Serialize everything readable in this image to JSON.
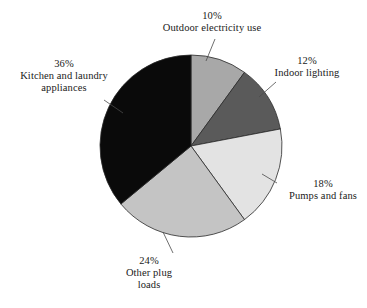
{
  "chart_data": {
    "type": "pie",
    "title": "",
    "subtitle": "",
    "xlabel": "",
    "ylabel": "",
    "legend_position": "none",
    "grid": false,
    "start_angle_deg": 0,
    "direction": "clockwise",
    "categories": [
      "Outdoor electricity use",
      "Indoor lighting",
      "Pumps and fans",
      "Other plug loads",
      "Kitchen and laundry appliances"
    ],
    "values": [
      10,
      12,
      18,
      24,
      36
    ],
    "value_unit": "%",
    "total": 100,
    "colors": [
      "#a8a8a8",
      "#5a5a5a",
      "#e3e3e3",
      "#c4c4c4",
      "#0a0a0a"
    ],
    "slices": [
      {
        "label": "Outdoor electricity use",
        "value": 10,
        "percent_text": "10%",
        "color": "#a8a8a8",
        "start_deg": 0,
        "end_deg": 36
      },
      {
        "label": "Indoor lighting",
        "value": 12,
        "percent_text": "12%",
        "color": "#5a5a5a",
        "start_deg": 36,
        "end_deg": 79.2
      },
      {
        "label": "Pumps and fans",
        "value": 18,
        "percent_text": "18%",
        "color": "#e3e3e3",
        "start_deg": 79.2,
        "end_deg": 144
      },
      {
        "label": "Other plug loads",
        "value": 24,
        "percent_text": "24%",
        "color": "#c4c4c4",
        "start_deg": 144,
        "end_deg": 230.4
      },
      {
        "label": "Kitchen and laundry appliances",
        "value": 36,
        "percent_text": "36%",
        "color": "#0a0a0a",
        "start_deg": 230.4,
        "end_deg": 360
      }
    ]
  },
  "labels": {
    "outdoor": {
      "percent": "10%",
      "line1": "Outdoor electricity use",
      "line2": ""
    },
    "indoor": {
      "percent": "12%",
      "line1": "Indoor lighting",
      "line2": ""
    },
    "pumps": {
      "percent": "18%",
      "line1": "Pumps and fans",
      "line2": ""
    },
    "other": {
      "percent": "24%",
      "line1": "Other plug",
      "line2": "loads"
    },
    "kitchen": {
      "percent": "36%",
      "line1": "Kitchen and laundry",
      "line2": "appliances"
    }
  },
  "style": {
    "background": "#ffffff",
    "text_color": "#1a1a1a",
    "leader_line_color": "#4a4a4a",
    "slice_outline_color": "#2a2a2a"
  }
}
